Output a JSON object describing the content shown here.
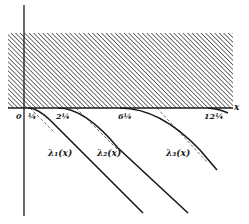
{
  "figure": {
    "axis": {
      "x_label": "x",
      "origin_label": "0",
      "ticks": [
        "¼",
        "2¼",
        "6¼",
        "12¼"
      ]
    },
    "shaded_region": "hatched strip above the x-axis",
    "curves": [
      {
        "label": "λ₁(x)",
        "starts_at": "¼"
      },
      {
        "label": "λ₂(x)",
        "starts_at": "2¼"
      },
      {
        "label": "λ₃(x)",
        "starts_at": "6¼"
      },
      {
        "label": "",
        "starts_at": "12¼"
      }
    ],
    "asymptotes": "dashed tangent lines beside each curve",
    "colors": {
      "ink": "#1a1a1a",
      "hatch": "#2a2a2a",
      "background": "#ffffff"
    }
  }
}
